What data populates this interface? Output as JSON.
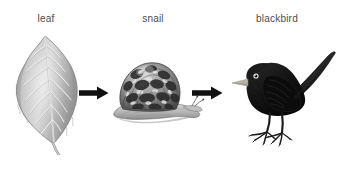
{
  "diagram": {
    "type": "food-chain",
    "background_color": "#ffffff",
    "label_color": "#4d4d4d",
    "arrow_color": "#111111",
    "stages": [
      {
        "id": "leaf",
        "label": "leaf",
        "icon": "leaf-illustration",
        "role": "producer",
        "tones": {
          "fill": "#b6b6b6",
          "shade": "#8f8f8f",
          "vein": "#e8e8e8",
          "outline": "#6f6f6f"
        }
      },
      {
        "id": "snail",
        "label": "snail",
        "icon": "snail-illustration",
        "role": "primary-consumer",
        "tones": {
          "shell_dark": "#2e2e2e",
          "shell_light": "#cfcfcf",
          "body": "#b9b9b9",
          "outline": "#5a5a5a"
        }
      },
      {
        "id": "blackbird",
        "label": "blackbird",
        "icon": "blackbird-illustration",
        "role": "secondary-consumer",
        "tones": {
          "body": "#141414",
          "highlight": "#3a3a3a",
          "beak": "#b9b4a4",
          "eye": "#ffffff",
          "legs": "#2a2a2a"
        }
      }
    ],
    "arrows": [
      {
        "id": "arrow-leaf-to-snail",
        "from": "leaf",
        "to": "snail",
        "direction": "right"
      },
      {
        "id": "arrow-snail-to-blackbird",
        "from": "snail",
        "to": "blackbird",
        "direction": "right"
      }
    ]
  }
}
